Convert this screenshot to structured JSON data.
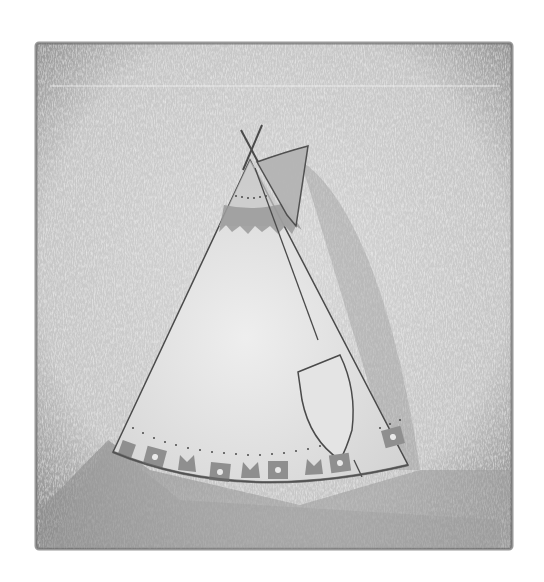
{
  "artwork": {
    "subject": "teepee",
    "medium": "pencil drawing",
    "colors": {
      "page": "#ffffff",
      "panel": "#c9c9c9",
      "panel_light": "#dedede",
      "panel_edge": "#6e6e6e",
      "shadow": "#8a8a8a",
      "teepee_body": "#e6e6e6",
      "band": "#9a9a9a",
      "flap": "#b4b4b4",
      "outline": "#4a4a4a",
      "motif_square": "#8f8f8f",
      "motif_dot": "#e8e8e8"
    },
    "panel": {
      "x": 36,
      "y": 43,
      "width": 476,
      "height": 506
    },
    "motifs": [
      "square",
      "M",
      "square",
      "M",
      "square",
      "M",
      "square",
      "M",
      "square",
      "square"
    ]
  }
}
